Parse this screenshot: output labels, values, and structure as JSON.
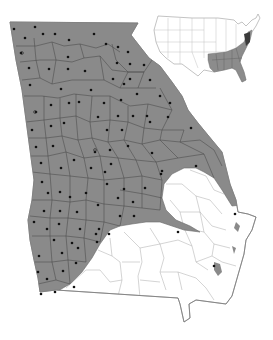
{
  "map": {
    "title": "Georgia distribution map",
    "region": "Georgia, USA",
    "inset_region": "Contiguous United States",
    "colors": {
      "range_fill": "#8a8a8a",
      "background": "#ffffff",
      "county_line": "#555555",
      "outside_line": "#9a9a9a",
      "record_dot": "#111111",
      "inset_range_fill": "#8c8c8c",
      "inset_dark_fill": "#3a3a3a"
    },
    "legend": {
      "shaded": "Distribution range",
      "dot": "County record"
    },
    "record_dots": [
      [
        14,
        29
      ],
      [
        35,
        27
      ],
      [
        43,
        34
      ],
      [
        55,
        34
      ],
      [
        25,
        38
      ],
      [
        69,
        40
      ],
      [
        94,
        34
      ],
      [
        106,
        44
      ],
      [
        118,
        47
      ],
      [
        128,
        52
      ],
      [
        21,
        53
      ],
      [
        68,
        57
      ],
      [
        29,
        68
      ],
      [
        49,
        69
      ],
      [
        68,
        69
      ],
      [
        85,
        71
      ],
      [
        117,
        63
      ],
      [
        130,
        64
      ],
      [
        144,
        65
      ],
      [
        130,
        79
      ],
      [
        113,
        79
      ],
      [
        150,
        80
      ],
      [
        30,
        85
      ],
      [
        61,
        89
      ],
      [
        91,
        90
      ],
      [
        124,
        84
      ],
      [
        137,
        94
      ],
      [
        51,
        105
      ],
      [
        69,
        103
      ],
      [
        79,
        102
      ],
      [
        104,
        103
      ],
      [
        121,
        100
      ],
      [
        160,
        96
      ],
      [
        36,
        112
      ],
      [
        98,
        117
      ],
      [
        118,
        116
      ],
      [
        133,
        116
      ],
      [
        147,
        116
      ],
      [
        170,
        103
      ],
      [
        64,
        123
      ],
      [
        51,
        126
      ],
      [
        107,
        130
      ],
      [
        122,
        130
      ],
      [
        150,
        122
      ],
      [
        168,
        117
      ],
      [
        191,
        128
      ],
      [
        32,
        130
      ],
      [
        36,
        147
      ],
      [
        53,
        146
      ],
      [
        95,
        152
      ],
      [
        110,
        150
      ],
      [
        128,
        146
      ],
      [
        152,
        153
      ],
      [
        74,
        160
      ],
      [
        111,
        164
      ],
      [
        41,
        163
      ],
      [
        61,
        168
      ],
      [
        91,
        168
      ],
      [
        105,
        172
      ],
      [
        161,
        174
      ],
      [
        196,
        166
      ],
      [
        42,
        182
      ],
      [
        107,
        184
      ],
      [
        48,
        193
      ],
      [
        60,
        192
      ],
      [
        86,
        193
      ],
      [
        124,
        189
      ],
      [
        145,
        188
      ],
      [
        162,
        171
      ],
      [
        44,
        211
      ],
      [
        60,
        211
      ],
      [
        77,
        212
      ],
      [
        98,
        205
      ],
      [
        118,
        198
      ],
      [
        133,
        202
      ],
      [
        70,
        197
      ],
      [
        34,
        222
      ],
      [
        59,
        224
      ],
      [
        47,
        229
      ],
      [
        80,
        229
      ],
      [
        99,
        229
      ],
      [
        120,
        216
      ],
      [
        134,
        216
      ],
      [
        235,
        214
      ],
      [
        178,
        232
      ],
      [
        109,
        234
      ],
      [
        54,
        240
      ],
      [
        72,
        243
      ],
      [
        96,
        234
      ],
      [
        39,
        256
      ],
      [
        62,
        253
      ],
      [
        78,
        248
      ],
      [
        97,
        242
      ],
      [
        38,
        272
      ],
      [
        63,
        271
      ],
      [
        76,
        263
      ],
      [
        47,
        279
      ],
      [
        41,
        294
      ],
      [
        55,
        292
      ],
      [
        74,
        287
      ],
      [
        214,
        266
      ]
    ],
    "hollow_dots": [
      [
        22,
        53
      ],
      [
        35,
        112
      ],
      [
        95,
        150
      ]
    ]
  }
}
